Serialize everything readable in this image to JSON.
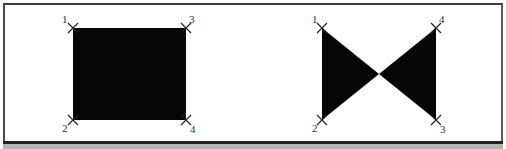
{
  "figures": {
    "rectangle": {
      "shape": "rectangle",
      "fill": "#050505",
      "vertices": [
        {
          "label": "1",
          "x": 73,
          "y": 28
        },
        {
          "label": "2",
          "x": 73,
          "y": 120
        },
        {
          "label": "3",
          "x": 186,
          "y": 28
        },
        {
          "label": "4",
          "x": 186,
          "y": 120
        }
      ]
    },
    "bowtie": {
      "shape": "bowtie",
      "fill": "#050505",
      "crossing": {
        "x": 379,
        "y": 74
      },
      "vertices": [
        {
          "label": "1",
          "x": 322,
          "y": 28
        },
        {
          "label": "2",
          "x": 322,
          "y": 120
        },
        {
          "label": "3",
          "x": 436,
          "y": 120
        },
        {
          "label": "4",
          "x": 436,
          "y": 28
        }
      ]
    }
  },
  "colors": {
    "frame_border": "#3c3c3c",
    "bottom_bar": "#222222",
    "bottom_band": "#b4b4b4",
    "marker": "#222222",
    "label": "#333333"
  }
}
